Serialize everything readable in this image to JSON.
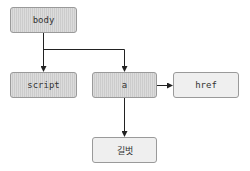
{
  "diagram": {
    "type": "dom-tree",
    "nodes": [
      {
        "id": "body",
        "label": "body",
        "kind": "element"
      },
      {
        "id": "script",
        "label": "script",
        "kind": "element"
      },
      {
        "id": "a",
        "label": "a",
        "kind": "element"
      },
      {
        "id": "href",
        "label": "href",
        "kind": "attribute"
      },
      {
        "id": "text",
        "label": "길벗",
        "kind": "text"
      }
    ],
    "edges": [
      {
        "from": "body",
        "to": "script"
      },
      {
        "from": "body",
        "to": "a"
      },
      {
        "from": "a",
        "to": "href"
      },
      {
        "from": "a",
        "to": "text"
      }
    ]
  },
  "colors": {
    "element_fill": "#d4d4d4",
    "attribute_fill": "#efefef",
    "border": "#9a9a9a",
    "edge": "#222222"
  }
}
